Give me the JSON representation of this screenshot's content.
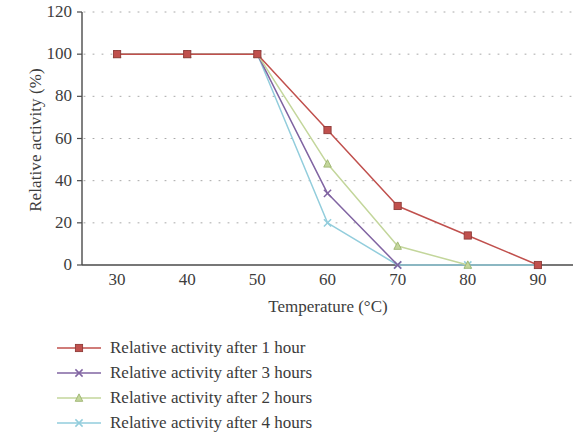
{
  "chart_data": {
    "type": "line",
    "title": "",
    "xlabel": "Temperature (°C)",
    "ylabel": "Relative activity (%)",
    "x": [
      30,
      40,
      50,
      60,
      70,
      80,
      90
    ],
    "xlim": [
      25,
      95
    ],
    "ylim": [
      0,
      120
    ],
    "xticks": [
      "30",
      "40",
      "50",
      "60",
      "70",
      "80",
      "90"
    ],
    "yticks": [
      "0",
      "20",
      "40",
      "60",
      "80",
      "100",
      "120"
    ],
    "grid": "dotted-horizontal",
    "legend_position": "below-left",
    "series": [
      {
        "name": "Relative activity after 1 hour",
        "color": "#c0504d",
        "marker": "square",
        "x": [
          30,
          40,
          50,
          60,
          70,
          80,
          90
        ],
        "values": [
          100,
          100,
          100,
          64,
          28,
          14,
          0
        ]
      },
      {
        "name": "Relative activity after 3 hours",
        "color": "#8064a2",
        "marker": "x",
        "x": [
          30,
          40,
          50,
          60,
          70
        ],
        "values": [
          100,
          100,
          100,
          34,
          0
        ]
      },
      {
        "name": "Relative activity after 2 hours",
        "color": "#c3d69b",
        "marker": "triangle",
        "x": [
          30,
          40,
          50,
          60,
          70,
          80
        ],
        "values": [
          100,
          100,
          100,
          48,
          9,
          0
        ]
      },
      {
        "name": "Relative activity after 4 hours",
        "color": "#92cddc",
        "marker": "x",
        "x": [
          30,
          40,
          50,
          60,
          70,
          80,
          90
        ],
        "values": [
          100,
          100,
          100,
          20,
          0,
          0,
          0
        ]
      }
    ]
  },
  "legend": {
    "items": [
      {
        "label": "Relative activity after 1 hour"
      },
      {
        "label": "Relative activity after 3 hours"
      },
      {
        "label": "Relative activity after 2 hours"
      },
      {
        "label": "Relative activity after 4 hours"
      }
    ]
  }
}
